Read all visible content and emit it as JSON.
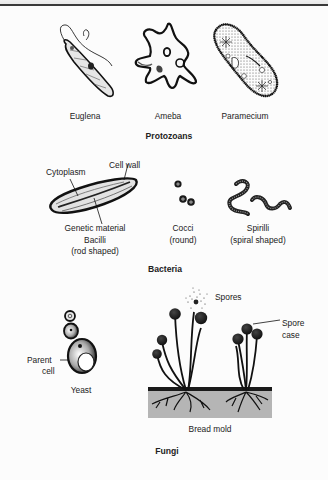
{
  "sections": {
    "protozoans": {
      "title": "Protozoans",
      "organisms": [
        {
          "name": "Euglena",
          "icon": "euglena-icon"
        },
        {
          "name": "Ameba",
          "icon": "ameba-icon"
        },
        {
          "name": "Paramecium",
          "icon": "paramecium-icon"
        }
      ]
    },
    "bacteria": {
      "title": "Bacteria",
      "bacilli": {
        "labels": {
          "cytoplasm": "Cytoplasm",
          "cell_wall": "Cell wall",
          "genetic_material": "Genetic material"
        },
        "name": "Bacilli",
        "description": "(rod shaped)"
      },
      "cocci": {
        "name": "Cocci",
        "description": "(round)"
      },
      "spirilli": {
        "name": "Spirilli",
        "description": "(spiral shaped)"
      }
    },
    "fungi": {
      "title": "Fungi",
      "yeast": {
        "name": "Yeast",
        "label_line1": "Parent",
        "label_line2": "cell"
      },
      "bread_mold": {
        "name": "Bread mold",
        "spores_label": "Spores",
        "spore_case_line1": "Spore",
        "spore_case_line2": "case"
      }
    }
  },
  "colors": {
    "ink": "#1a1a1a",
    "bread": "#b5b5b5",
    "background": "#fcfcfc"
  }
}
